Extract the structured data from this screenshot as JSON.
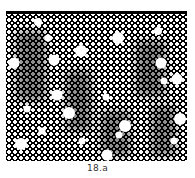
{
  "figure": {
    "caption": "18.a",
    "style": "halftone dot pattern",
    "colors": {
      "ink": "#000000",
      "paper": "#ffffff"
    },
    "large_dots": [
      {
        "x": 38,
        "y": 22,
        "r": 4
      },
      {
        "x": 48,
        "y": 38,
        "r": 3.5
      },
      {
        "x": 118,
        "y": 38,
        "r": 6
      },
      {
        "x": 81,
        "y": 51,
        "r": 6
      },
      {
        "x": 54,
        "y": 60,
        "r": 5.5
      },
      {
        "x": 14,
        "y": 63,
        "r": 5.5
      },
      {
        "x": 161,
        "y": 63,
        "r": 5.5
      },
      {
        "x": 158,
        "y": 31,
        "r": 4
      },
      {
        "x": 177,
        "y": 79,
        "r": 5.5
      },
      {
        "x": 164,
        "y": 81,
        "r": 3.5
      },
      {
        "x": 57,
        "y": 95,
        "r": 5.5
      },
      {
        "x": 106,
        "y": 97,
        "r": 3.5
      },
      {
        "x": 69,
        "y": 113,
        "r": 6
      },
      {
        "x": 27,
        "y": 109,
        "r": 3.5
      },
      {
        "x": 180,
        "y": 119,
        "r": 6
      },
      {
        "x": 125,
        "y": 126,
        "r": 6
      },
      {
        "x": 42,
        "y": 131,
        "r": 3.5
      },
      {
        "x": 119,
        "y": 135,
        "r": 3.5
      },
      {
        "x": 21,
        "y": 144,
        "r": 6
      },
      {
        "x": 82,
        "y": 141,
        "r": 3.5
      },
      {
        "x": 174,
        "y": 141,
        "r": 3.5
      },
      {
        "x": 107,
        "y": 155,
        "r": 5.5
      }
    ]
  }
}
